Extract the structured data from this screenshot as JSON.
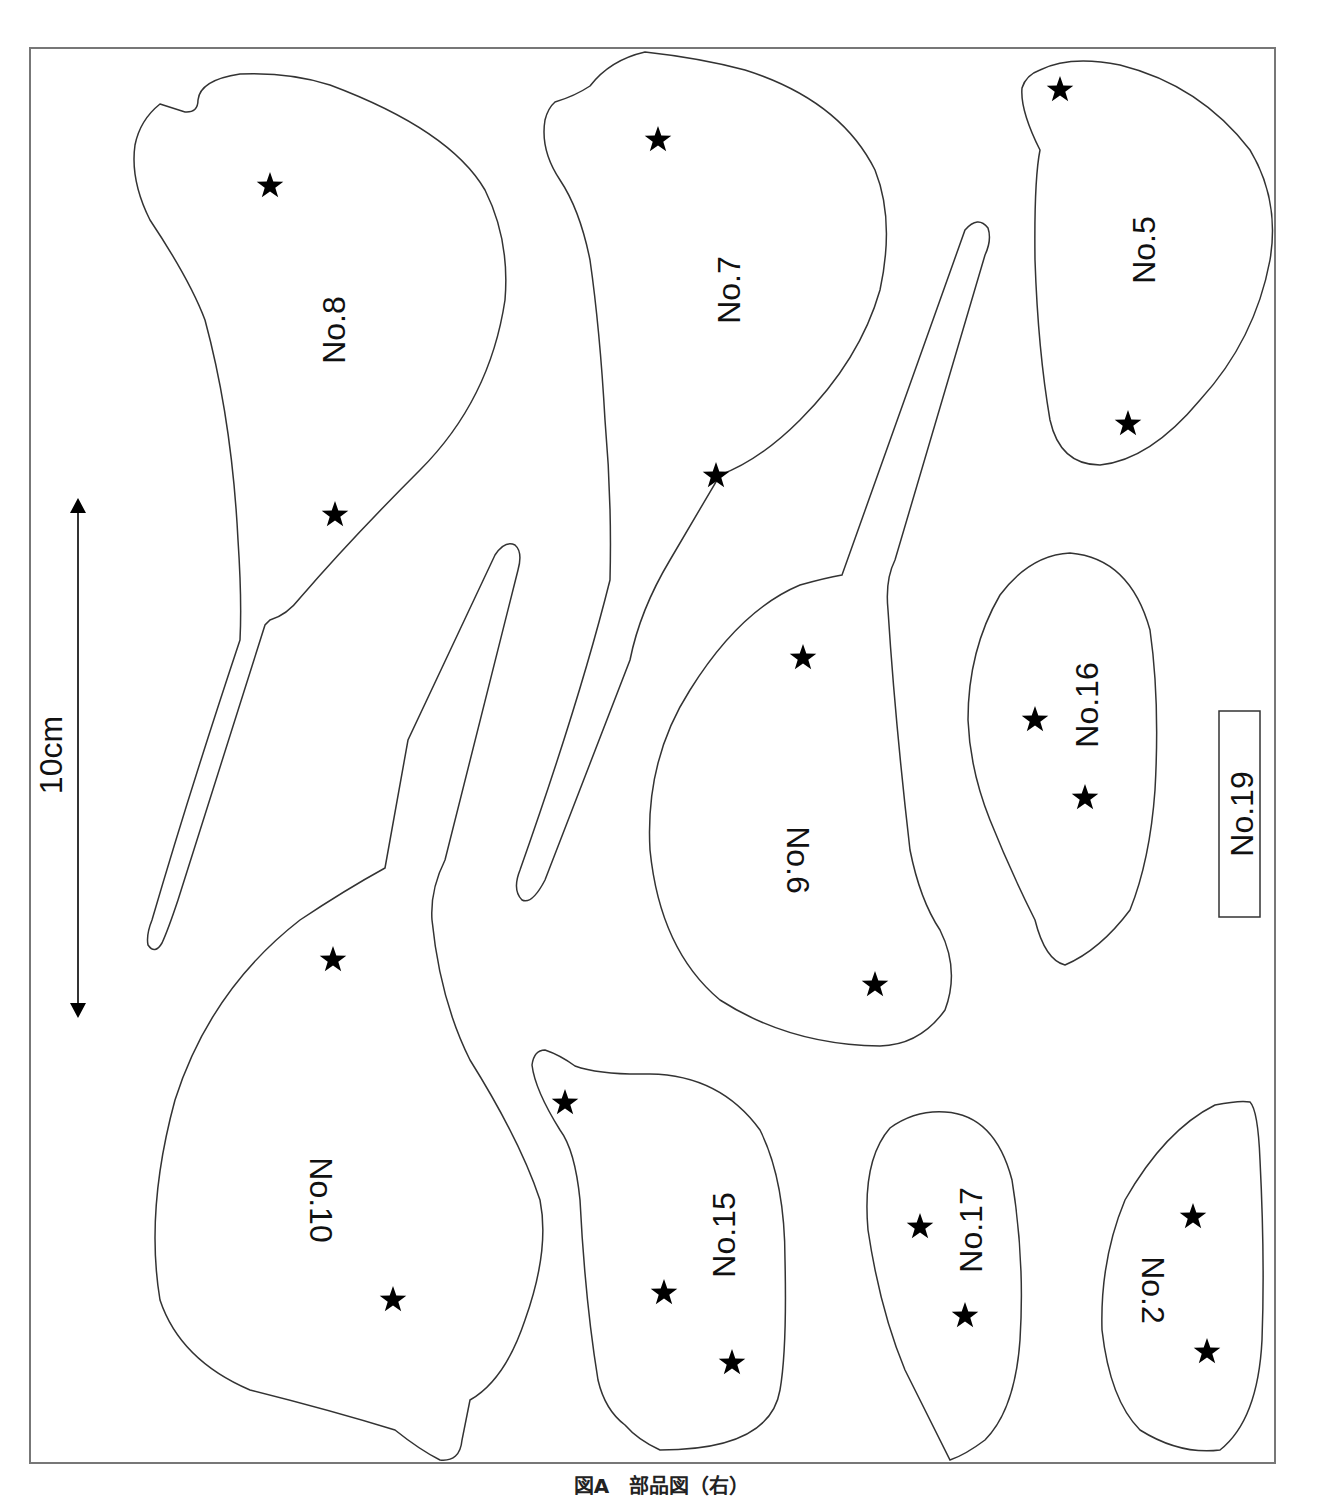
{
  "figure": {
    "caption": "図A　部品図（右）",
    "scale_bar_label": "10cm",
    "line_color": "#333333",
    "star_color": "#000000",
    "border_color": "#777777"
  },
  "parts": [
    {
      "id": "no8",
      "label": "No.8",
      "stars": 2
    },
    {
      "id": "no7",
      "label": "No.7",
      "stars": 2
    },
    {
      "id": "no5",
      "label": "No.5",
      "stars": 2
    },
    {
      "id": "no6",
      "label": "No.6",
      "stars": 2
    },
    {
      "id": "no16",
      "label": "No.16",
      "stars": 2
    },
    {
      "id": "no19",
      "label": "No.19",
      "stars": 0
    },
    {
      "id": "no10",
      "label": "No.10",
      "stars": 2
    },
    {
      "id": "no15",
      "label": "No.15",
      "stars": 3
    },
    {
      "id": "no17",
      "label": "No.17",
      "stars": 2
    },
    {
      "id": "no2",
      "label": "No.2",
      "stars": 2
    }
  ]
}
